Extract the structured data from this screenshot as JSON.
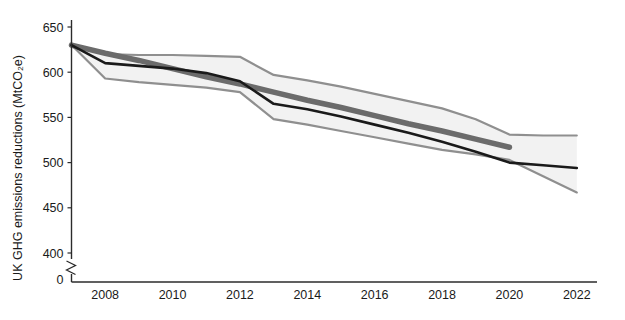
{
  "chart_data": {
    "type": "line",
    "title": "",
    "xlabel": "",
    "ylabel": "UK GHG emissions reductions (MtCO₂e)",
    "xlim": [
      2007,
      2022.6
    ],
    "ylim": [
      400,
      650
    ],
    "yticks": [
      400,
      450,
      500,
      550,
      600,
      650
    ],
    "ytick_labels": [
      "400",
      "450",
      "500",
      "550",
      "600",
      "650"
    ],
    "y_axis_break": true,
    "y_axis_break_label": "0",
    "xticks": [
      2008,
      2010,
      2012,
      2014,
      2016,
      2018,
      2020,
      2022
    ],
    "xtick_labels": [
      "2008",
      "2010",
      "2012",
      "2014",
      "2016",
      "2018",
      "2020",
      "2022"
    ],
    "grid": false,
    "legend": "none",
    "x": [
      2007,
      2008,
      2009,
      2010,
      2011,
      2012,
      2013,
      2014,
      2015,
      2016,
      2017,
      2018,
      2019,
      2020,
      2021,
      2022
    ],
    "series": [
      {
        "name": "Actual emissions reductions",
        "style": "line",
        "color": "#1a1a1a",
        "width": 2.6,
        "values": [
          630,
          610,
          607,
          604,
          599,
          590,
          565,
          559,
          551,
          542,
          533,
          523,
          512,
          500,
          497,
          494
        ]
      },
      {
        "name": "Linear reduction pathway",
        "style": "line",
        "color": "#6b6b6b",
        "width": 5.5,
        "x_end": 2020,
        "values": [
          630,
          621,
          613,
          604,
          595,
          587,
          578,
          569,
          561,
          552,
          543,
          535,
          526,
          517,
          null,
          null
        ]
      },
      {
        "name": "Uncertainty range (upper bound)",
        "style": "band-edge",
        "color": "#8f8f8f",
        "width": 2.2,
        "values": [
          630,
          620,
          619,
          619,
          618,
          617,
          597,
          591,
          584,
          576,
          568,
          560,
          548,
          531,
          530,
          530
        ]
      },
      {
        "name": "Uncertainty range (lower bound)",
        "style": "band-edge",
        "color": "#8f8f8f",
        "width": 2.2,
        "values": [
          630,
          593,
          589,
          586,
          583,
          578,
          548,
          542,
          535,
          528,
          521,
          514,
          509,
          503,
          485,
          467
        ]
      }
    ],
    "band_fill_color": "#f2f2f2",
    "annotations": []
  },
  "axis": {
    "y_title": "UK GHG emissions reductions (MtCO₂e)",
    "zero_label": "0"
  }
}
